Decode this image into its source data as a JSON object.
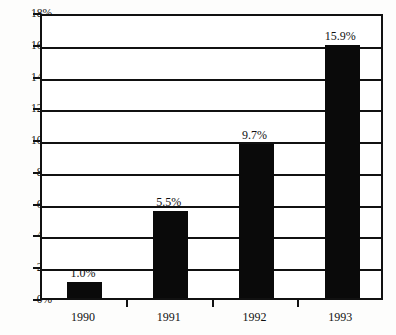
{
  "chart_data": {
    "type": "bar",
    "title": "",
    "subtitle": "",
    "xlabel": "",
    "ylabel": "",
    "categories": [
      "1990",
      "1991",
      "1992",
      "1993"
    ],
    "values": [
      1.0,
      5.5,
      9.7,
      15.9
    ],
    "data_labels": [
      "1.0%",
      "5.5%",
      "9.7%",
      "15.9%"
    ],
    "series": [
      {
        "name": "",
        "values": [
          1.0,
          5.5,
          9.7,
          15.9
        ]
      }
    ],
    "ylim": [
      0,
      18
    ],
    "ytick_step": 2,
    "ytick_labels": [
      "0%",
      "2%",
      "4%",
      "6%",
      "8%",
      "10%",
      "12%",
      "14%",
      "16%",
      "18%"
    ],
    "ytick_values": [
      0,
      2,
      4,
      6,
      8,
      10,
      12,
      14,
      16,
      18
    ],
    "grid": true,
    "grid_axis": "y",
    "legend": false,
    "legend_position": "none",
    "bar_color": "#0a0a0a",
    "axis_color": "#111111",
    "plot_background": "#ffffff"
  }
}
